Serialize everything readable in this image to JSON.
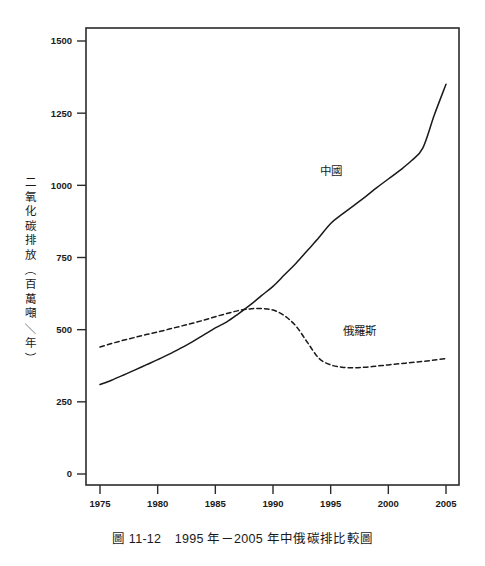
{
  "figure": {
    "caption": "圖 11-12　1995 年－2005 年中俄碳排比較圖",
    "caption_number": "圖 11-12",
    "caption_text": "1995 年－2005 年中俄碳排比較圖"
  },
  "chart_data": {
    "type": "line",
    "title": "",
    "xlabel": "",
    "ylabel": "二氧化碳排放（百萬噸／年）",
    "xlim": [
      1975,
      2005
    ],
    "ylim": [
      0,
      1560
    ],
    "xticks": [
      1975,
      1980,
      1985,
      1990,
      1995,
      2000,
      2005
    ],
    "xtick_labels": [
      "1975",
      "1980",
      "1985",
      "1990",
      "1995",
      "2000",
      "2005"
    ],
    "yticks": [
      0,
      250,
      500,
      750,
      1000,
      1250,
      1500
    ],
    "ytick_labels": [
      "0",
      "250",
      "500",
      "750",
      "1000",
      "1250",
      "1500"
    ],
    "grid": false,
    "legend_position": "inline-annotation",
    "frame": "box",
    "series": [
      {
        "name": "中國",
        "style": "solid",
        "color": "#1a1a1a",
        "label_x": 1995,
        "label_y": 1035,
        "x": [
          1975,
          1976,
          1977,
          1978,
          1979,
          1980,
          1981,
          1982,
          1983,
          1984,
          1985,
          1986,
          1987,
          1988,
          1989,
          1990,
          1991,
          1992,
          1993,
          1994,
          1995,
          1996,
          1997,
          1998,
          1999,
          2000,
          2001,
          2002,
          2003,
          2004,
          2005
        ],
        "values": [
          310,
          325,
          342,
          360,
          378,
          396,
          415,
          436,
          458,
          482,
          506,
          527,
          555,
          585,
          618,
          650,
          690,
          730,
          775,
          820,
          868,
          900,
          930,
          960,
          992,
          1022,
          1052,
          1085,
          1130,
          1245,
          1350
        ]
      },
      {
        "name": "俄羅斯",
        "style": "dashed",
        "color": "#1a1a1a",
        "label_x": 1997.5,
        "label_y": 482,
        "x": [
          1975,
          1976,
          1977,
          1978,
          1979,
          1980,
          1981,
          1982,
          1983,
          1984,
          1985,
          1986,
          1987,
          1988,
          1989,
          1990,
          1991,
          1992,
          1993,
          1994,
          1995,
          1996,
          1997,
          1998,
          1999,
          2000,
          2001,
          2002,
          2003,
          2004,
          2005
        ],
        "values": [
          440,
          452,
          463,
          473,
          483,
          492,
          502,
          512,
          522,
          533,
          545,
          556,
          566,
          572,
          573,
          568,
          548,
          512,
          455,
          400,
          378,
          370,
          368,
          370,
          374,
          378,
          382,
          386,
          390,
          395,
          400
        ]
      }
    ],
    "annotations": [
      {
        "text": "中國",
        "x": 1995,
        "y": 1035
      },
      {
        "text": "俄羅斯",
        "x": 1997.5,
        "y": 482
      }
    ]
  }
}
